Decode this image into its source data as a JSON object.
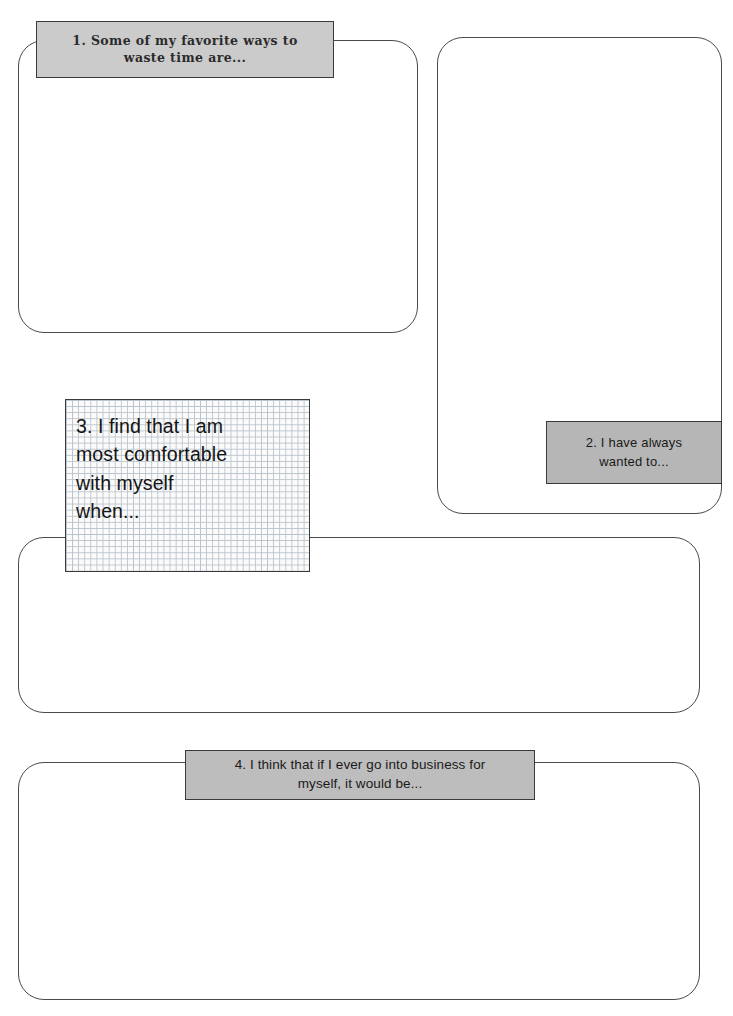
{
  "page": {
    "type": "worksheet",
    "background_color": "#ffffff",
    "width": 733,
    "height": 1016
  },
  "style": {
    "box_border_color": "#4a4a4a",
    "label_border_color": "#3a3a3a",
    "label_1_fill": "#cbcbcb",
    "label_2_fill": "#b6b6b6",
    "label_3_fill": "#fbfbfb",
    "label_3_grid_color": "#b9c3cb",
    "label_4_fill": "#bdbdbd",
    "text_color": "#1a1a1a"
  },
  "prompts": [
    {
      "number": "1.",
      "text": "1. Some of my favorite ways to waste time are...",
      "line_1": "1. Some of my favorite ways to",
      "line_2": "waste time are...",
      "align": "center",
      "fill": "#cbcbcb"
    },
    {
      "number": "2.",
      "text": "2. I have always wanted to...",
      "line_1": "2. I have always",
      "line_2": "wanted to...",
      "align": "center",
      "fill": "#b6b6b6"
    },
    {
      "number": "3.",
      "text": "3. I find that I am most comfortable with myself when...",
      "line_1": "3. I find that I am",
      "line_2": "most comfortable",
      "line_3": "with myself",
      "line_4": "when...",
      "align": "left",
      "fill": "#fbfbfb"
    },
    {
      "number": "4.",
      "text": "4. I think that if I ever go into business for myself, it would be...",
      "line_1": "4. I think that if I ever go into business for",
      "line_2": "myself, it would be...",
      "align": "center",
      "fill": "#bdbdbd"
    }
  ],
  "answer_boxes": [
    {
      "for_prompt": "1",
      "value": "",
      "placeholder": ""
    },
    {
      "for_prompt": "2",
      "value": "",
      "placeholder": ""
    },
    {
      "for_prompt": "3",
      "value": "",
      "placeholder": ""
    },
    {
      "for_prompt": "4",
      "value": "",
      "placeholder": ""
    }
  ]
}
